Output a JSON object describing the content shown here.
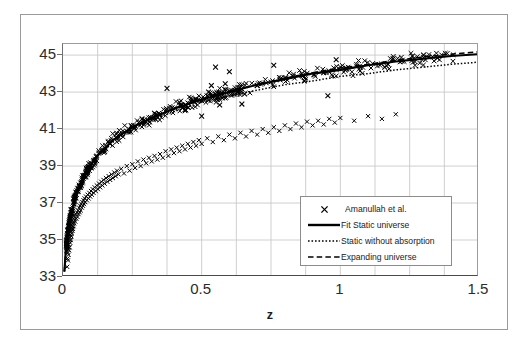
{
  "chart_data": {
    "type": "scatter",
    "title": "",
    "xlabel": "z",
    "ylabel": "",
    "xlim": [
      0,
      1.5
    ],
    "ylim": [
      33,
      45.6
    ],
    "grid": true,
    "x_ticks": [
      "0",
      "0.5",
      "1",
      "1.5"
    ],
    "x_tick_values": [
      0,
      0.5,
      1,
      1.5
    ],
    "y_ticks": [
      "33",
      "35",
      "37",
      "39",
      "41",
      "43",
      "45"
    ],
    "y_tick_values": [
      33,
      35,
      37,
      39,
      41,
      43,
      45
    ],
    "x_gridline_step": 0.125,
    "y_gridline_step": 2,
    "legend_position": "inside-lower-right",
    "series": [
      {
        "name": "Amanullah et al.",
        "type": "scatter",
        "marker": "x",
        "color": "#000000",
        "note": "supernova distance modulus measurements, dense below z=0.1, scattered with outliers between z=0.35 and z=1.0"
      },
      {
        "name": "Fit Static universe",
        "type": "line",
        "style": "solid",
        "color": "#000000",
        "points": [
          [
            0.005,
            33.3
          ],
          [
            0.01,
            34.4
          ],
          [
            0.02,
            35.7
          ],
          [
            0.03,
            36.5
          ],
          [
            0.05,
            37.6
          ],
          [
            0.08,
            38.6
          ],
          [
            0.12,
            39.5
          ],
          [
            0.18,
            40.4
          ],
          [
            0.25,
            41.1
          ],
          [
            0.32,
            41.6
          ],
          [
            0.4,
            42.1
          ],
          [
            0.5,
            42.6
          ],
          [
            0.6,
            43.0
          ],
          [
            0.7,
            43.4
          ],
          [
            0.8,
            43.7
          ],
          [
            0.9,
            44.0
          ],
          [
            1.0,
            44.2
          ],
          [
            1.1,
            44.45
          ],
          [
            1.2,
            44.65
          ],
          [
            1.3,
            44.8
          ],
          [
            1.4,
            44.95
          ],
          [
            1.5,
            45.05
          ]
        ]
      },
      {
        "name": "Static without absorption",
        "type": "line",
        "style": "dotted",
        "color": "#000000",
        "points": [
          [
            0.005,
            33.3
          ],
          [
            0.01,
            34.4
          ],
          [
            0.02,
            35.7
          ],
          [
            0.03,
            36.5
          ],
          [
            0.05,
            37.6
          ],
          [
            0.08,
            38.6
          ],
          [
            0.12,
            39.45
          ],
          [
            0.18,
            40.3
          ],
          [
            0.25,
            41.0
          ],
          [
            0.32,
            41.5
          ],
          [
            0.4,
            41.95
          ],
          [
            0.5,
            42.45
          ],
          [
            0.6,
            42.8
          ],
          [
            0.7,
            43.1
          ],
          [
            0.8,
            43.4
          ],
          [
            0.9,
            43.6
          ],
          [
            1.0,
            43.85
          ],
          [
            1.1,
            44.0
          ],
          [
            1.2,
            44.2
          ],
          [
            1.3,
            44.35
          ],
          [
            1.4,
            44.5
          ],
          [
            1.5,
            44.62
          ]
        ]
      },
      {
        "name": "Expanding universe",
        "type": "line",
        "style": "dashed",
        "color": "#000000",
        "points": [
          [
            0.005,
            33.3
          ],
          [
            0.01,
            34.4
          ],
          [
            0.02,
            35.7
          ],
          [
            0.03,
            36.5
          ],
          [
            0.05,
            37.6
          ],
          [
            0.08,
            38.6
          ],
          [
            0.12,
            39.5
          ],
          [
            0.18,
            40.4
          ],
          [
            0.25,
            41.1
          ],
          [
            0.32,
            41.6
          ],
          [
            0.4,
            42.1
          ],
          [
            0.5,
            42.6
          ],
          [
            0.6,
            43.05
          ],
          [
            0.7,
            43.4
          ],
          [
            0.8,
            43.75
          ],
          [
            0.9,
            44.05
          ],
          [
            1.0,
            44.3
          ],
          [
            1.1,
            44.5
          ],
          [
            1.2,
            44.72
          ],
          [
            1.3,
            44.9
          ],
          [
            1.4,
            45.05
          ],
          [
            1.5,
            45.18
          ]
        ]
      }
    ],
    "scatter_points": [
      [
        0.015,
        33.55
      ],
      [
        0.016,
        34.0
      ],
      [
        0.017,
        34.3
      ],
      [
        0.018,
        33.9
      ],
      [
        0.019,
        34.6
      ],
      [
        0.02,
        34.2
      ],
      [
        0.021,
        34.75
      ],
      [
        0.022,
        34.45
      ],
      [
        0.023,
        35.0
      ],
      [
        0.024,
        34.6
      ],
      [
        0.025,
        35.15
      ],
      [
        0.026,
        34.85
      ],
      [
        0.027,
        35.3
      ],
      [
        0.028,
        35.0
      ],
      [
        0.029,
        35.45
      ],
      [
        0.03,
        35.2
      ],
      [
        0.031,
        35.6
      ],
      [
        0.032,
        35.35
      ],
      [
        0.033,
        35.75
      ],
      [
        0.034,
        35.5
      ],
      [
        0.035,
        35.9
      ],
      [
        0.036,
        35.6
      ],
      [
        0.037,
        36.0
      ],
      [
        0.038,
        35.75
      ],
      [
        0.039,
        36.15
      ],
      [
        0.04,
        35.9
      ],
      [
        0.042,
        36.25
      ],
      [
        0.044,
        36.0
      ],
      [
        0.046,
        36.4
      ],
      [
        0.048,
        36.15
      ],
      [
        0.05,
        36.5
      ],
      [
        0.052,
        36.25
      ],
      [
        0.054,
        36.6
      ],
      [
        0.056,
        36.4
      ],
      [
        0.058,
        36.75
      ],
      [
        0.06,
        36.5
      ],
      [
        0.062,
        36.85
      ],
      [
        0.064,
        36.6
      ],
      [
        0.066,
        36.95
      ],
      [
        0.068,
        36.75
      ],
      [
        0.07,
        37.05
      ],
      [
        0.072,
        36.85
      ],
      [
        0.074,
        37.15
      ],
      [
        0.076,
        36.95
      ],
      [
        0.078,
        37.25
      ],
      [
        0.08,
        37.05
      ],
      [
        0.083,
        37.35
      ],
      [
        0.086,
        37.15
      ],
      [
        0.089,
        37.45
      ],
      [
        0.092,
        37.25
      ],
      [
        0.095,
        37.55
      ],
      [
        0.098,
        37.35
      ],
      [
        0.101,
        37.65
      ],
      [
        0.104,
        37.45
      ],
      [
        0.107,
        37.75
      ],
      [
        0.11,
        37.55
      ],
      [
        0.114,
        37.85
      ],
      [
        0.118,
        37.65
      ],
      [
        0.122,
        37.95
      ],
      [
        0.126,
        37.75
      ],
      [
        0.13,
        38.05
      ],
      [
        0.134,
        37.85
      ],
      [
        0.138,
        38.15
      ],
      [
        0.142,
        37.95
      ],
      [
        0.146,
        38.25
      ],
      [
        0.15,
        38.05
      ],
      [
        0.155,
        38.35
      ],
      [
        0.16,
        38.15
      ],
      [
        0.165,
        38.45
      ],
      [
        0.17,
        38.25
      ],
      [
        0.175,
        38.55
      ],
      [
        0.18,
        38.35
      ],
      [
        0.185,
        38.65
      ],
      [
        0.19,
        38.45
      ],
      [
        0.195,
        38.75
      ],
      [
        0.2,
        38.55
      ],
      [
        0.21,
        38.85
      ],
      [
        0.22,
        38.6
      ],
      [
        0.23,
        39.0
      ],
      [
        0.24,
        38.75
      ],
      [
        0.25,
        39.1
      ],
      [
        0.26,
        38.9
      ],
      [
        0.27,
        39.25
      ],
      [
        0.28,
        39.0
      ],
      [
        0.29,
        39.35
      ],
      [
        0.3,
        39.15
      ],
      [
        0.31,
        39.45
      ],
      [
        0.32,
        39.25
      ],
      [
        0.33,
        39.55
      ],
      [
        0.34,
        39.35
      ],
      [
        0.35,
        39.65
      ],
      [
        0.36,
        39.45
      ],
      [
        0.37,
        39.8
      ],
      [
        0.38,
        39.55
      ],
      [
        0.39,
        39.9
      ],
      [
        0.4,
        39.7
      ],
      [
        0.41,
        40.0
      ],
      [
        0.42,
        39.8
      ],
      [
        0.43,
        40.1
      ],
      [
        0.44,
        39.9
      ],
      [
        0.45,
        40.2
      ],
      [
        0.46,
        40.0
      ],
      [
        0.47,
        40.3
      ],
      [
        0.48,
        40.1
      ],
      [
        0.49,
        40.4
      ],
      [
        0.5,
        40.2
      ],
      [
        0.52,
        40.5
      ],
      [
        0.54,
        40.3
      ],
      [
        0.56,
        40.6
      ],
      [
        0.58,
        40.4
      ],
      [
        0.6,
        40.7
      ],
      [
        0.62,
        40.5
      ],
      [
        0.64,
        40.8
      ],
      [
        0.66,
        40.6
      ],
      [
        0.68,
        40.9
      ],
      [
        0.7,
        40.7
      ],
      [
        0.72,
        41.0
      ],
      [
        0.74,
        40.8
      ],
      [
        0.76,
        41.1
      ],
      [
        0.78,
        40.9
      ],
      [
        0.8,
        41.2
      ],
      [
        0.82,
        41.0
      ],
      [
        0.84,
        41.3
      ],
      [
        0.86,
        41.1
      ],
      [
        0.88,
        41.4
      ],
      [
        0.9,
        41.2
      ],
      [
        0.92,
        41.45
      ],
      [
        0.94,
        41.25
      ],
      [
        0.96,
        41.55
      ],
      [
        0.98,
        41.35
      ],
      [
        1.0,
        41.6
      ],
      [
        1.05,
        41.45
      ],
      [
        1.1,
        41.7
      ],
      [
        1.15,
        41.55
      ],
      [
        1.2,
        41.8
      ]
    ]
  },
  "legend": {
    "items": [
      {
        "label": "Amanullah et al.",
        "key": "marker-x"
      },
      {
        "label": "Fit Static universe",
        "key": "solid-line"
      },
      {
        "label": "Static without absorption",
        "key": "dotted-line"
      },
      {
        "label": "Expanding universe",
        "key": "dashed-line"
      }
    ]
  },
  "axes": {
    "x_title": "z",
    "x_tick_labels": [
      "0",
      "0.5",
      "1",
      "1.5"
    ],
    "y_tick_labels": [
      "45",
      "43",
      "41",
      "39",
      "37",
      "35",
      "33"
    ]
  }
}
